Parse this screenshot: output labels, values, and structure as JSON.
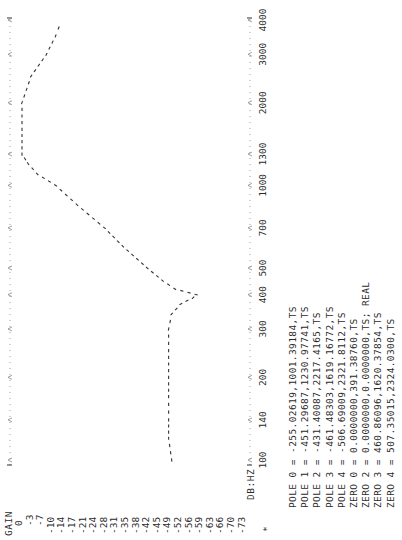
{
  "chart": {
    "y_axis_title": "GAIN",
    "x_axis_title": "DB:HZ",
    "marker": "*",
    "gain_ticks": [
      "0",
      "-3",
      "-7",
      "-10",
      "-14",
      "-17",
      "-21",
      "-24",
      "-28",
      "-31",
      "-35",
      "-38",
      "-42",
      "-45",
      "-49",
      "-52",
      "-56",
      "-59",
      "-63",
      "-66",
      "-70",
      "-73"
    ],
    "freq_ticks": [
      "100",
      "140",
      "200",
      "300",
      "400",
      "500",
      "700",
      "1000",
      "1300",
      "2000",
      "3000",
      "4000"
    ],
    "trace_color": "#333333",
    "grid_color": "#888888"
  },
  "poles_zeros": [
    "POLE 0 = -255.02619,1001.39184,TS",
    "POLE 1 = -451.29687,1230.97741,TS",
    "POLE 2 = -431.40087,2217.4165,TS",
    "POLE 3 = -461.48303,1619.16772,TS",
    "POLE 4 = -506.69009,2321.8112,TS",
    "ZERO 0 = 0.0000000,391.38760,TS",
    "ZERO 2 = 0.0000000,0.0000000,TS; REAL",
    "ZERO 3 = 460.86096,1620.37854,TS",
    "ZERO 4 = 507.35015,2324.0300,TS"
  ],
  "chart_data": {
    "type": "line",
    "title": "",
    "xlabel": "DB:HZ",
    "ylabel": "GAIN",
    "x_scale": "log",
    "x_ticks": [
      100,
      140,
      200,
      300,
      400,
      500,
      700,
      1000,
      1300,
      2000,
      3000,
      4000
    ],
    "y_ticks": [
      0,
      -3,
      -7,
      -10,
      -14,
      -17,
      -21,
      -24,
      -28,
      -31,
      -35,
      -38,
      -42,
      -45,
      -49,
      -52,
      -56,
      -59,
      -63,
      -66,
      -70,
      -73
    ],
    "ylim": [
      -73,
      0
    ],
    "xlim": [
      100,
      4000
    ],
    "series": [
      {
        "name": "gain response",
        "x": [
          100,
          120,
          140,
          170,
          200,
          250,
          300,
          340,
          370,
          390,
          400,
          420,
          450,
          500,
          600,
          700,
          850,
          1000,
          1100,
          1200,
          1300,
          1600,
          2000,
          2500,
          3000,
          3500,
          4000
        ],
        "y": [
          -49,
          -48,
          -48,
          -48,
          -48,
          -48,
          -48,
          -49,
          -52,
          -56,
          -57,
          -50,
          -46,
          -41,
          -33,
          -27,
          -18,
          -11,
          -5,
          -2,
          0,
          0,
          0,
          -3,
          -8,
          -11,
          -13
        ]
      }
    ],
    "grid": false,
    "annotations": [
      "POLE 0 = -255.02619,1001.39184,TS",
      "POLE 1 = -451.29687,1230.97741,TS",
      "POLE 2 = -431.40087,2217.4165,TS",
      "POLE 3 = -461.48303,1619.16772,TS",
      "POLE 4 = -506.69009,2321.8112,TS",
      "ZERO 0 = 0.0000000,391.38760,TS",
      "ZERO 2 = 0.0000000,0.0000000,TS; REAL",
      "ZERO 3 = 460.86096,1620.37854,TS",
      "ZERO 4 = 507.35015,2324.0300,TS"
    ]
  }
}
